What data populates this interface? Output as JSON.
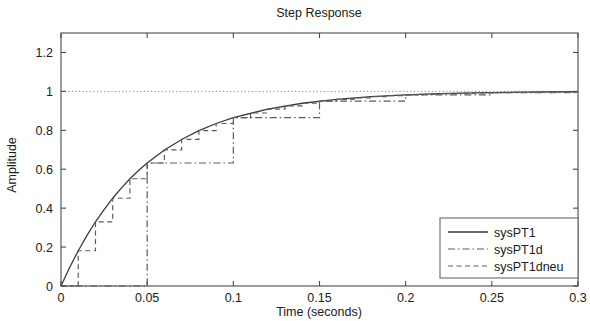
{
  "chart_data": {
    "type": "line",
    "title": "Step Response",
    "xlabel": "Time (seconds)",
    "ylabel": "Amplitude",
    "xlim": [
      0,
      0.3
    ],
    "ylim": [
      0,
      1.3
    ],
    "xticks": [
      0,
      0.05,
      0.1,
      0.15,
      0.2,
      0.25,
      0.3
    ],
    "xtick_labels": [
      "0",
      "0.05",
      "0.1",
      "0.15",
      "0.2",
      "0.25",
      "0.3"
    ],
    "yticks": [
      0,
      0.2,
      0.4,
      0.6,
      0.8,
      1,
      1.2
    ],
    "ytick_labels": [
      "0",
      "0.2",
      "0.4",
      "0.6",
      "0.8",
      "1",
      "1.2"
    ],
    "grid": false,
    "reference_line": {
      "y": 1,
      "style": "dotted"
    },
    "legend_position": "lower right",
    "series": [
      {
        "name": "sysPT1",
        "style": "solid",
        "kind": "continuous",
        "model": "1 - exp(-t/0.05)",
        "x": [
          0,
          0.005,
          0.01,
          0.015,
          0.02,
          0.025,
          0.03,
          0.035,
          0.04,
          0.045,
          0.05,
          0.06,
          0.07,
          0.08,
          0.09,
          0.1,
          0.12,
          0.14,
          0.16,
          0.18,
          0.2,
          0.22,
          0.24,
          0.26,
          0.28,
          0.3
        ],
        "y": [
          0,
          0.095,
          0.181,
          0.259,
          0.33,
          0.393,
          0.451,
          0.503,
          0.551,
          0.593,
          0.632,
          0.699,
          0.753,
          0.798,
          0.835,
          0.865,
          0.909,
          0.939,
          0.959,
          0.973,
          0.982,
          0.988,
          0.992,
          0.995,
          0.997,
          0.998
        ]
      },
      {
        "name": "sysPT1d",
        "style": "dashdot",
        "kind": "zoh-staircase",
        "sample_time": 0.05,
        "x": [
          0,
          0.05,
          0.1,
          0.15,
          0.2,
          0.25,
          0.3
        ],
        "y": [
          0,
          0.632,
          0.865,
          0.95,
          0.982,
          0.993,
          0.998
        ]
      },
      {
        "name": "sysPT1dneu",
        "style": "dashed",
        "kind": "zoh-staircase",
        "sample_time": 0.01,
        "x": [
          0,
          0.01,
          0.02,
          0.03,
          0.04,
          0.05,
          0.06,
          0.07,
          0.08,
          0.09,
          0.1,
          0.11,
          0.12,
          0.13,
          0.14,
          0.15,
          0.16,
          0.17,
          0.18,
          0.19,
          0.2,
          0.21,
          0.22,
          0.23,
          0.24,
          0.25,
          0.26,
          0.27,
          0.28,
          0.29,
          0.3
        ],
        "y": [
          0,
          0.181,
          0.33,
          0.451,
          0.551,
          0.632,
          0.699,
          0.753,
          0.798,
          0.835,
          0.865,
          0.889,
          0.909,
          0.926,
          0.939,
          0.95,
          0.959,
          0.967,
          0.973,
          0.978,
          0.982,
          0.985,
          0.988,
          0.99,
          0.992,
          0.993,
          0.995,
          0.996,
          0.997,
          0.997,
          0.998
        ]
      }
    ]
  },
  "legend": {
    "entries": [
      {
        "label": "sysPT1"
      },
      {
        "label": "sysPT1d"
      },
      {
        "label": "sysPT1dneu"
      }
    ]
  },
  "colors": {
    "axis": "#4a4a4a",
    "curve": "#3b3b3b",
    "sampled": "#5c5c5c",
    "reference": "#8a8a8a",
    "background": "#ffffff"
  }
}
